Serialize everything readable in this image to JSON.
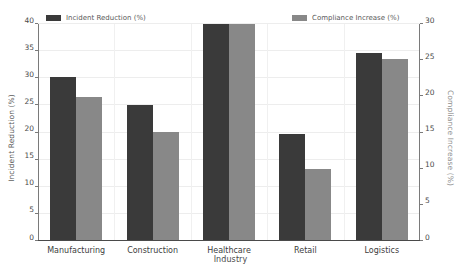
{
  "chart_data": {
    "type": "bar",
    "title": "",
    "subtitle": "",
    "xlabel": "Industry",
    "ylabel": "Incident Reduction (%)",
    "y2label": "Compliance Increase (%)",
    "categories": [
      "Manufacturing",
      "Construction",
      "Healthcare",
      "Retail",
      "Logistics"
    ],
    "series": [
      {
        "name": "Incident Reduction (%)",
        "axis": "left",
        "color": "#3a3a3a",
        "values": [
          30.0,
          24.8,
          39.8,
          19.6,
          34.5
        ]
      },
      {
        "name": "Compliance Increase (%)",
        "axis": "right",
        "color": "#888888",
        "values": [
          19.8,
          15.0,
          29.8,
          9.8,
          25.0
        ]
      }
    ],
    "ylim": [
      0,
      40
    ],
    "y2lim": [
      0,
      30
    ],
    "yticks": [
      0,
      5,
      10,
      15,
      20,
      25,
      30,
      35,
      40
    ],
    "y2ticks": [
      0,
      5,
      10,
      15,
      20,
      25,
      30
    ],
    "grid": true,
    "legend_position": "top",
    "background": "#ffffff"
  },
  "legend": {
    "left": {
      "label": "Incident Reduction (%)",
      "color": "#3a3a3a"
    },
    "right": {
      "label": "Compliance Increase (%)",
      "color": "#888888"
    }
  },
  "axes": {
    "left_title": "Incident Reduction (%)",
    "right_title": "Compliance Increase (%)",
    "x_title": "Industry"
  }
}
